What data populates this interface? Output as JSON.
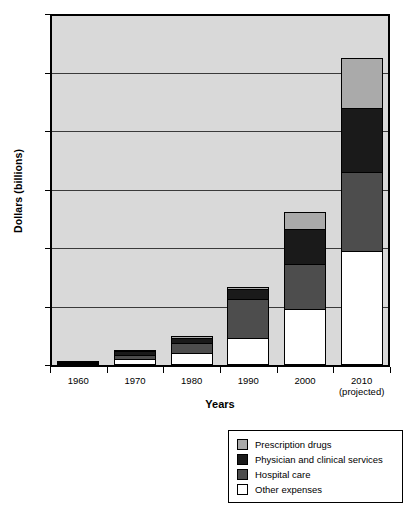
{
  "chart_data": {
    "type": "bar",
    "subtype": "stacked-bar",
    "title": "",
    "xlabel": "Years",
    "ylabel": "Dollars (billions)",
    "ylim": [
      0,
      3000
    ],
    "ytick_values": [
      0,
      500,
      1000,
      1500,
      2000,
      2500,
      3000
    ],
    "ytick_labels": [
      "0",
      "500",
      "1000",
      "1500",
      "2000",
      "2500",
      "3000"
    ],
    "grid": true,
    "legend_position": "below-right",
    "categories": [
      "1960",
      "1970",
      "1980",
      "1990",
      "2000",
      "2010"
    ],
    "category_sublabels": [
      "",
      "",
      "",
      "",
      "",
      "(projected)"
    ],
    "series": [
      {
        "name": "Other expenses",
        "color": "#ffffff",
        "values": [
          20,
          48,
          100,
          230,
          480,
          970
        ]
      },
      {
        "name": "Hospital care",
        "color": "#4d4d4d",
        "values": [
          9,
          38,
          85,
          330,
          380,
          680
        ]
      },
      {
        "name": "Physician and clinical services",
        "color": "#1a1a1a",
        "values": [
          6,
          30,
          50,
          90,
          300,
          550
        ]
      },
      {
        "name": "Prescription drugs",
        "color": "#aaaaaa",
        "values": [
          2,
          9,
          15,
          20,
          150,
          420
        ]
      }
    ],
    "totals": [
      37,
      125,
      250,
      670,
      1310,
      2620
    ]
  },
  "axes": {
    "y_title": "Dollars (billions)",
    "x_title": "Years"
  },
  "legend": {
    "items": [
      {
        "label": "Prescription drugs",
        "color": "#aaaaaa"
      },
      {
        "label": "Physician and clinical services",
        "color": "#1a1a1a"
      },
      {
        "label": "Hospital care",
        "color": "#4d4d4d"
      },
      {
        "label": "Other expenses",
        "color": "#ffffff"
      }
    ]
  }
}
